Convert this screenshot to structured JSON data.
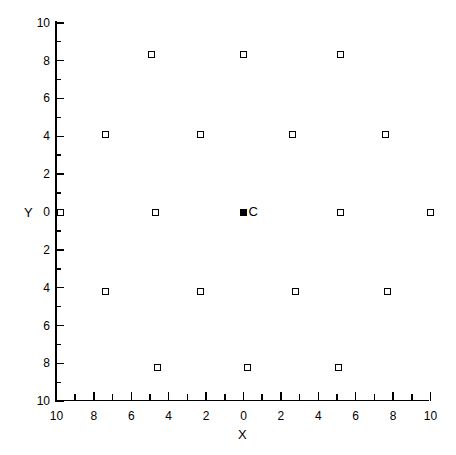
{
  "chart_data": {
    "type": "scatter",
    "title": "",
    "xlabel": "X",
    "ylabel": "Y",
    "xlim": [
      -10,
      10
    ],
    "ylim": [
      -10,
      10
    ],
    "grid": false,
    "legend": null,
    "axis_label_style": "absolute-distance",
    "xticks": [
      -10,
      -8,
      -6,
      -4,
      -2,
      0,
      2,
      4,
      6,
      8,
      10
    ],
    "xticklabels": [
      "10",
      "8",
      "6",
      "4",
      "2",
      "0",
      "2",
      "4",
      "6",
      "8",
      "10"
    ],
    "yticks": [
      10,
      8,
      6,
      4,
      2,
      0,
      -2,
      -4,
      -6,
      -8,
      -10
    ],
    "yticklabels": [
      "10",
      "8",
      "6",
      "4",
      "2",
      "0",
      "2",
      "4",
      "6",
      "8",
      "10"
    ],
    "minor_ticks_between_majors": 1,
    "series": [
      {
        "name": "satellites",
        "marker": "open-square",
        "points": [
          {
            "x": -4.9,
            "y": 8.3
          },
          {
            "x": 0.0,
            "y": 8.3
          },
          {
            "x": 5.2,
            "y": 8.3
          },
          {
            "x": -7.4,
            "y": 4.1
          },
          {
            "x": -2.3,
            "y": 4.1
          },
          {
            "x": 2.6,
            "y": 4.1
          },
          {
            "x": 7.6,
            "y": 4.1
          },
          {
            "x": -9.8,
            "y": 0.0
          },
          {
            "x": -4.7,
            "y": 0.0
          },
          {
            "x": 5.2,
            "y": 0.0
          },
          {
            "x": 10.0,
            "y": 0.0
          },
          {
            "x": -7.4,
            "y": -4.2
          },
          {
            "x": -2.3,
            "y": -4.2
          },
          {
            "x": 2.8,
            "y": -4.2
          },
          {
            "x": 7.7,
            "y": -4.2
          },
          {
            "x": -4.6,
            "y": -8.2
          },
          {
            "x": 0.2,
            "y": -8.2
          },
          {
            "x": 5.1,
            "y": -8.2
          }
        ]
      },
      {
        "name": "center",
        "marker": "filled-square",
        "points": [
          {
            "x": 0.0,
            "y": 0.0,
            "label": "C"
          }
        ]
      }
    ]
  },
  "labels": {
    "x_axis_name": "X",
    "y_axis_name": "Y",
    "center_point": "C"
  },
  "colors": {
    "axis": "#000000",
    "marker_edge": "#000000",
    "marker_face": "#ffffff",
    "center_marker": "#000000",
    "background": "#ffffff"
  }
}
